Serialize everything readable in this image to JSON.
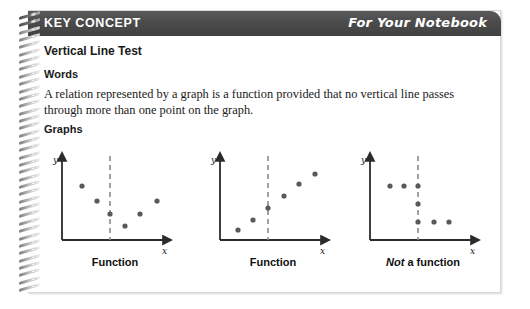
{
  "header": {
    "title": "KEY CONCEPT",
    "notebook_label": "For Your Notebook",
    "bar_color": "#4b4b4b",
    "text_color": "#ffffff"
  },
  "body": {
    "concept_title": "Vertical Line Test",
    "words_heading": "Words",
    "words_text": "A relation represented by a graph is a function provided that no vertical line passes through more than one point on the graph.",
    "graphs_heading": "Graphs"
  },
  "graphs": [
    {
      "caption_prefix": "",
      "caption": "Function",
      "y_axis_label": "y",
      "x_axis_label": "x",
      "is_function": true,
      "dashed_line_x": 48,
      "points": [
        {
          "x": 20,
          "y": 26
        },
        {
          "x": 35,
          "y": 41
        },
        {
          "x": 48,
          "y": 54
        },
        {
          "x": 63,
          "y": 66
        },
        {
          "x": 78,
          "y": 54
        },
        {
          "x": 95,
          "y": 41
        }
      ]
    },
    {
      "caption_prefix": "",
      "caption": "Function",
      "y_axis_label": "y",
      "x_axis_label": "x",
      "is_function": true,
      "dashed_line_x": 48,
      "points": [
        {
          "x": 18,
          "y": 74
        },
        {
          "x": 33,
          "y": 64
        },
        {
          "x": 48,
          "y": 52
        },
        {
          "x": 64,
          "y": 40
        },
        {
          "x": 79,
          "y": 28
        },
        {
          "x": 95,
          "y": 18
        }
      ]
    },
    {
      "caption_prefix": "Not",
      "caption": " a function",
      "y_axis_label": "y",
      "x_axis_label": "x",
      "is_function": false,
      "dashed_line_x": 48,
      "points": [
        {
          "x": 20,
          "y": 26
        },
        {
          "x": 34,
          "y": 26
        },
        {
          "x": 48,
          "y": 26
        },
        {
          "x": 48,
          "y": 44
        },
        {
          "x": 48,
          "y": 62
        },
        {
          "x": 64,
          "y": 62
        },
        {
          "x": 79,
          "y": 62
        }
      ]
    }
  ],
  "style": {
    "axis_color": "#2b2b2b",
    "point_color": "#59595b",
    "dash_color": "#8a8a8c",
    "page_background": "#ffffff"
  }
}
